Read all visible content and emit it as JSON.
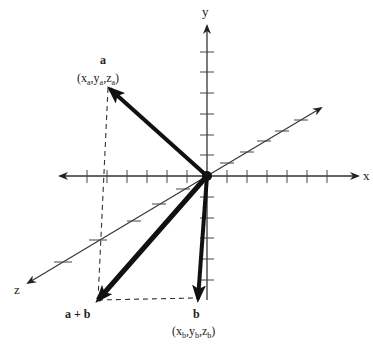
{
  "diagram": {
    "type": "3d-vector-addition",
    "axes": {
      "x": {
        "label": "x",
        "ticks_positive": 6,
        "ticks_negative": 8
      },
      "y": {
        "label": "y",
        "ticks_positive": 6,
        "ticks_negative": 5
      },
      "z": {
        "label": "z",
        "ticks_positive": 5,
        "ticks_negative": 6
      }
    },
    "vectors": [
      {
        "id": "a",
        "name": "a",
        "coords_label": {
          "pre": "(x",
          "s1": "a",
          "m1": ",y",
          "s2": "a",
          "m2": ",z",
          "s3": "a",
          "post": ")"
        }
      },
      {
        "id": "b",
        "name": "b",
        "coords_label": {
          "pre": "(x",
          "s1": "b",
          "m1": ",y",
          "s2": "b",
          "m2": ",z",
          "s3": "b",
          "post": ")"
        }
      },
      {
        "id": "a_plus_b",
        "name": "a + b"
      }
    ],
    "colors": {
      "ink": "#111111",
      "axis": "#333333",
      "dash": "#333333"
    }
  }
}
